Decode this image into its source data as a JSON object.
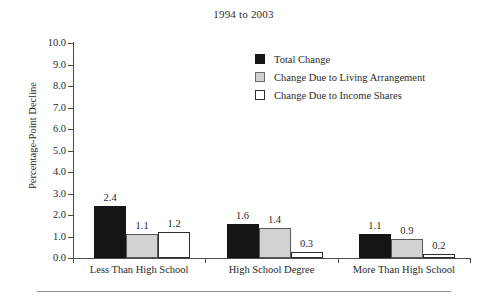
{
  "figure": {
    "title": "1994 to 2003"
  },
  "chart_data": {
    "type": "bar",
    "title": "1994 to 2003",
    "xlabel": "",
    "ylabel": "Percentage-Point Decline",
    "ylim": [
      0.0,
      10.0
    ],
    "ytick_step": 1.0,
    "grid": false,
    "legend_position": "upper-right-inside",
    "categories": [
      "Less Than High School",
      "High School Degree",
      "More Than High School"
    ],
    "series": [
      {
        "name": "Total Change",
        "color": "#151515",
        "values": [
          2.4,
          1.6,
          1.1
        ],
        "value_labels": [
          "2.4",
          "1.6",
          "1.1"
        ]
      },
      {
        "name": "Change Due to Living Arrangement",
        "color": "#d2d2d2",
        "values": [
          1.1,
          1.4,
          0.9
        ],
        "value_labels": [
          "1.1",
          "1.4",
          "0.9"
        ]
      },
      {
        "name": "Change Due to Income Shares",
        "color": "#ffffff",
        "values": [
          1.2,
          0.3,
          0.2
        ],
        "value_labels": [
          "1.2",
          "0.3",
          "0.2"
        ]
      }
    ],
    "ytick_labels": [
      "10.0",
      "9.0",
      "8.0",
      "7.0",
      "6.0",
      "5.0",
      "4.0",
      "3.0",
      "2.0",
      "1.0",
      "0.0"
    ]
  },
  "axes": {
    "y_title": "Percentage-Point Decline",
    "y_ticks": [
      {
        "value": 10.0,
        "label": "10.0"
      },
      {
        "value": 9.0,
        "label": "9.0"
      },
      {
        "value": 8.0,
        "label": "8.0"
      },
      {
        "value": 7.0,
        "label": "7.0"
      },
      {
        "value": 6.0,
        "label": "6.0"
      },
      {
        "value": 5.0,
        "label": "5.0"
      },
      {
        "value": 4.0,
        "label": "4.0"
      },
      {
        "value": 3.0,
        "label": "3.0"
      },
      {
        "value": 2.0,
        "label": "2.0"
      },
      {
        "value": 1.0,
        "label": "1.0"
      },
      {
        "value": 0.0,
        "label": "0.0"
      }
    ],
    "x_groups": [
      {
        "label": "Less Than High School"
      },
      {
        "label": "High School Degree"
      },
      {
        "label": "More Than High School"
      }
    ]
  },
  "legend": {
    "items": [
      {
        "label": "Total Change",
        "swatch": "legend-swatch-black"
      },
      {
        "label": "Change Due to Living Arrangement",
        "swatch": "legend-swatch-gray"
      },
      {
        "label": "Change Due to Income Shares",
        "swatch": "legend-swatch-white"
      }
    ]
  }
}
